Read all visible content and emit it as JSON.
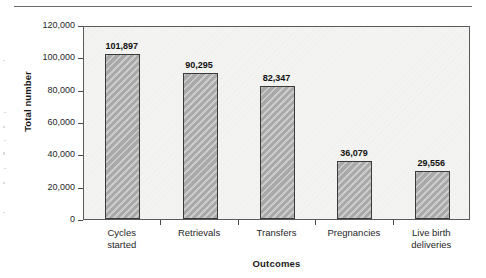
{
  "figure": {
    "has_top_rule": true
  },
  "chart_data": {
    "type": "bar",
    "title": "",
    "xlabel": "Outcomes",
    "ylabel": "Total number",
    "categories": [
      "Cycles started",
      "Retrievals",
      "Transfers",
      "Pregnancies",
      "Live birth deliveries"
    ],
    "category_lines": [
      [
        "Cycles",
        "started"
      ],
      [
        "Retrievals"
      ],
      [
        "Transfers"
      ],
      [
        "Pregnancies"
      ],
      [
        "Live birth",
        "deliveries"
      ]
    ],
    "values": [
      101897,
      90295,
      82347,
      36079,
      29556
    ],
    "value_labels": [
      "101,897",
      "90,295",
      "82,347",
      "36,079",
      "29,556"
    ],
    "ylim": [
      0,
      120000
    ],
    "ytick_values": [
      0,
      20000,
      40000,
      60000,
      80000,
      100000,
      120000
    ],
    "ytick_labels": [
      "0",
      "20,000",
      "40,000",
      "60,000",
      "80,000",
      "100,000",
      "120,000"
    ],
    "grid": false,
    "legend": null,
    "bar_color": "#a9a9a9",
    "bar_edge_color": "#3a3a3a",
    "plot_background": "#f3f3f1",
    "axis_color": "#5a5a5a"
  }
}
